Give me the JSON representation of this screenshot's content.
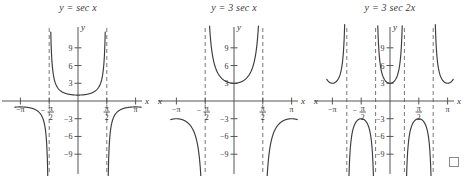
{
  "figure": {
    "background": "#ffffff",
    "curve_color": "#3b3b3b",
    "axis_color": "#555555",
    "asymptote_color": "#777777",
    "end_of_proof_marker": "□"
  },
  "panels": [
    {
      "id": "panel-sec-x",
      "title": "y = sec x",
      "title_parts": {
        "y": "y",
        "eq": "=",
        "expr": "sec x"
      },
      "axis": {
        "x_label": "x",
        "y_label": "y",
        "x_label_left": "",
        "x_ticks": [
          {
            "value": -3.14159,
            "label": "−π",
            "type": "plain"
          },
          {
            "value": -1.5708,
            "label": "-pi/2",
            "type": "fraction",
            "sign": "−",
            "numerator": "π",
            "denominator": "2"
          },
          {
            "value": 1.5708,
            "label": "pi/2",
            "type": "fraction",
            "sign": "",
            "numerator": "π",
            "denominator": "2"
          },
          {
            "value": 3.14159,
            "label": "π",
            "type": "plain"
          }
        ],
        "y_ticks": [
          {
            "value": 9,
            "label": "9"
          },
          {
            "value": 6,
            "label": "6"
          },
          {
            "value": 3,
            "label": "3"
          },
          {
            "value": -3,
            "label": "−3"
          },
          {
            "value": -6,
            "label": "−6"
          },
          {
            "value": -9,
            "label": "−9"
          }
        ],
        "xlim": [
          -3.6,
          3.6
        ],
        "ylim": [
          -11,
          11
        ]
      },
      "asymptotes": [
        -1.5708,
        1.5708
      ],
      "branches": [
        {
          "name": "left-tail",
          "x_range": [
            -3.45,
            -1.62
          ],
          "sign": "negative"
        },
        {
          "name": "center-u",
          "x_range": [
            -1.52,
            1.52
          ],
          "sign": "positive"
        },
        {
          "name": "right-tail",
          "x_range": [
            1.62,
            3.45
          ],
          "sign": "negative"
        }
      ]
    },
    {
      "id": "panel-3sec-x",
      "title": "y = 3 sec x",
      "title_parts": {
        "y": "y",
        "eq": "=",
        "coef": "3",
        "expr": "sec x"
      },
      "axis": {
        "x_label": "x",
        "y_label": "y",
        "x_label_left": "x",
        "x_ticks": [
          {
            "value": -3.14159,
            "label": "−π",
            "type": "plain"
          },
          {
            "value": -1.5708,
            "label": "-pi/2",
            "type": "fraction",
            "sign": "−",
            "numerator": "π",
            "denominator": "2"
          },
          {
            "value": 1.5708,
            "label": "pi/2",
            "type": "fraction",
            "sign": "",
            "numerator": "π",
            "denominator": "2"
          },
          {
            "value": 3.14159,
            "label": "π",
            "type": "plain"
          }
        ],
        "y_ticks": [
          {
            "value": 9,
            "label": "9"
          },
          {
            "value": 6,
            "label": "6"
          },
          {
            "value": 3,
            "label": "3"
          },
          {
            "value": -3,
            "label": "−3"
          },
          {
            "value": -6,
            "label": "−6"
          },
          {
            "value": -9,
            "label": "−9"
          }
        ],
        "xlim": [
          -3.6,
          3.6
        ],
        "ylim": [
          -11,
          11
        ]
      },
      "asymptotes": [
        -1.5708,
        1.5708
      ],
      "branches": [
        {
          "name": "left-tail",
          "x_range": [
            -3.45,
            -1.66
          ],
          "sign": "negative"
        },
        {
          "name": "center-u",
          "x_range": [
            -1.48,
            1.48
          ],
          "sign": "positive"
        },
        {
          "name": "right-tail",
          "x_range": [
            1.66,
            3.45
          ],
          "sign": "negative"
        }
      ]
    },
    {
      "id": "panel-3sec-2x",
      "title": "y = 3 sec 2x",
      "title_parts": {
        "y": "y",
        "eq": "=",
        "coef": "3",
        "expr": "sec 2x"
      },
      "axis": {
        "x_label": "x",
        "y_label": "y",
        "x_label_left": "x",
        "x_ticks": [
          {
            "value": -3.14159,
            "label": "−π",
            "type": "plain"
          },
          {
            "value": -1.5708,
            "label": "-pi/2",
            "type": "fraction",
            "sign": "−",
            "numerator": "π",
            "denominator": "2"
          },
          {
            "value": 1.5708,
            "label": "pi/2",
            "type": "fraction",
            "sign": "",
            "numerator": "π",
            "denominator": "2"
          },
          {
            "value": 3.14159,
            "label": "π",
            "type": "plain"
          }
        ],
        "y_ticks": [
          {
            "value": 9,
            "label": "9"
          },
          {
            "value": 6,
            "label": "6"
          },
          {
            "value": 3,
            "label": "3"
          },
          {
            "value": -3,
            "label": "−3"
          },
          {
            "value": -6,
            "label": "−6"
          },
          {
            "value": -9,
            "label": "−9"
          }
        ],
        "xlim": [
          -3.6,
          3.6
        ],
        "ylim": [
          -11,
          11
        ]
      },
      "asymptotes": [
        -2.35619,
        -0.7854,
        0.7854,
        2.35619
      ],
      "branches": [
        {
          "name": "far-left-u",
          "x_range": [
            -3.45,
            -2.43
          ],
          "sign": "positive"
        },
        {
          "name": "left-inverted-u",
          "x_range": [
            -2.28,
            -0.86
          ],
          "sign": "negative"
        },
        {
          "name": "center-u",
          "x_range": [
            -0.71,
            0.71
          ],
          "sign": "positive"
        },
        {
          "name": "right-inverted-u",
          "x_range": [
            0.86,
            2.28
          ],
          "sign": "negative"
        },
        {
          "name": "far-right-u",
          "x_range": [
            2.43,
            3.45
          ],
          "sign": "positive"
        }
      ]
    }
  ],
  "chart_data": {
    "type": "line",
    "xlabel": "x",
    "ylabel": "y",
    "xlim": [
      -3.6,
      3.6
    ],
    "ylim": [
      -11,
      11
    ],
    "grid": false,
    "legend": "none",
    "x_tick_labels": [
      "−π",
      "−π/2",
      "π/2",
      "π"
    ],
    "x_tick_values": [
      -3.14159,
      -1.5708,
      1.5708,
      3.14159
    ],
    "y_tick_labels": [
      "9",
      "6",
      "3",
      "−3",
      "−6",
      "−9"
    ],
    "y_tick_values": [
      9,
      6,
      3,
      -3,
      -6,
      -9
    ],
    "series": [
      {
        "name": "y = sec x",
        "formula": "sec(x)",
        "amplitude": 1,
        "frequency": 1,
        "period": 6.28319,
        "asymptotes": [
          -1.5708,
          1.5708
        ],
        "minima_of_upper_branches": [
          {
            "x": 0,
            "y": 1
          }
        ],
        "maxima_of_lower_branches": [
          {
            "x": -3.14159,
            "y": -1
          },
          {
            "x": 3.14159,
            "y": -1
          }
        ]
      },
      {
        "name": "y = 3 sec x",
        "formula": "3*sec(x)",
        "amplitude": 3,
        "frequency": 1,
        "period": 6.28319,
        "asymptotes": [
          -1.5708,
          1.5708
        ],
        "minima_of_upper_branches": [
          {
            "x": 0,
            "y": 3
          }
        ],
        "maxima_of_lower_branches": [
          {
            "x": -3.14159,
            "y": -3
          },
          {
            "x": 3.14159,
            "y": -3
          }
        ]
      },
      {
        "name": "y = 3 sec 2x",
        "formula": "3*sec(2x)",
        "amplitude": 3,
        "frequency": 2,
        "period": 3.14159,
        "asymptotes": [
          -2.35619,
          -0.7854,
          0.7854,
          2.35619
        ],
        "minima_of_upper_branches": [
          {
            "x": -3.14159,
            "y": 3
          },
          {
            "x": 0,
            "y": 3
          },
          {
            "x": 3.14159,
            "y": 3
          }
        ],
        "maxima_of_lower_branches": [
          {
            "x": -1.5708,
            "y": -3
          },
          {
            "x": 1.5708,
            "y": -3
          }
        ]
      }
    ]
  }
}
